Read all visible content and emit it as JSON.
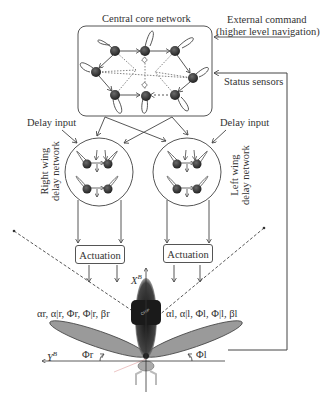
{
  "labels": {
    "central_core": "Central core network",
    "external_command_line1": "External command",
    "external_command_line2": "(higher level navigation)",
    "status_sensors": "Status sensors",
    "delay_input_left": "Delay input",
    "delay_input_right": "Delay input",
    "right_wing_line1": "Right wing",
    "right_wing_line2": "delay network",
    "left_wing_line1": "Left wing",
    "left_wing_line2": "delay network",
    "actuation_left": "Actuation",
    "actuation_right": "Actuation",
    "body_axis_x": "X",
    "body_axis_x_sup": "B",
    "body_axis_y": "Y",
    "body_axis_y_sup": "B",
    "right_params": "αr, α|r, Φr, Φ|r, βr",
    "left_params": "αl, α|l, Φl, Φ|l, βl",
    "phi_r": "Φr",
    "phi_l": "Φl"
  },
  "colors": {
    "line": "#444444",
    "node": "#3a3a3a",
    "wing": "#9a9a9a",
    "body": "#2a2a2a"
  }
}
